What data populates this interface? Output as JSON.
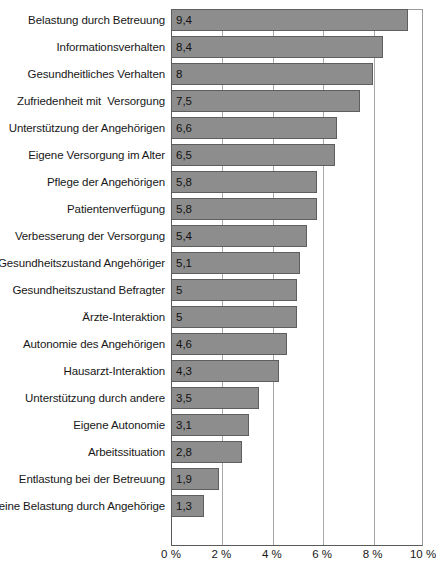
{
  "chart_data": {
    "type": "bar",
    "orientation": "horizontal",
    "title": "",
    "xlabel": "",
    "ylabel": "",
    "xlim": [
      0,
      10
    ],
    "xticks": [
      0,
      2,
      4,
      6,
      8,
      10
    ],
    "xtick_labels": [
      "0 %",
      "2 %",
      "4 %",
      "6 %",
      "8 %",
      "10 %"
    ],
    "grid": true,
    "legend": false,
    "value_decimal_separator": ",",
    "categories": [
      "Belastung durch Betreuung",
      "Informationsverhalten",
      "Gesundheitliches Verhalten",
      "Zufriedenheit mit  Versorgung",
      "Unterstützung der Angehörigen",
      "Eigene Versorgung im Alter",
      "Pflege der Angehörigen",
      "Patientenverfügung",
      "Verbesserung der Versorgung",
      "Gesundheitszustand Angehöriger",
      "Gesundheitszustand Befragter",
      "Ärzte-Interaktion",
      "Autonomie des Angehörigen",
      "Hausarzt-Interaktion",
      "Unterstützung durch andere",
      "Eigene Autonomie",
      "Arbeitssituation",
      "Entlastung bei der Betreuung",
      "Keine Belastung durch Angehörige"
    ],
    "values": [
      9.4,
      8.4,
      8,
      7.5,
      6.6,
      6.5,
      5.8,
      5.8,
      5.4,
      5.1,
      5,
      5,
      4.6,
      4.3,
      3.5,
      3.1,
      2.8,
      1.9,
      1.3
    ],
    "value_labels": [
      "9,4",
      "8,4",
      "8",
      "7,5",
      "6,6",
      "6,5",
      "5,8",
      "5,8",
      "5,4",
      "5,1",
      "5",
      "5",
      "4,6",
      "4,3",
      "3,5",
      "3,1",
      "2,8",
      "1,9",
      "1,3"
    ],
    "bar_color": "#8d8d8d",
    "bar_border_color": "#5e5e5e",
    "grid_color": "#a8a8a8",
    "axis_color": "#5a5a5a"
  },
  "caption": ""
}
